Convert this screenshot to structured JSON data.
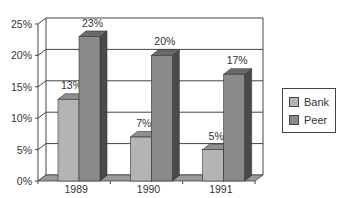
{
  "chart_data": {
    "type": "bar",
    "title": "",
    "xlabel": "",
    "ylabel": "",
    "categories": [
      "1989",
      "1990",
      "1991"
    ],
    "series": [
      {
        "name": "Bank",
        "values": [
          13,
          7,
          5
        ],
        "labels": [
          "13%",
          "7%",
          "5%"
        ],
        "color": "#b4b4b4"
      },
      {
        "name": "Peer",
        "values": [
          23,
          20,
          17
        ],
        "labels": [
          "23%",
          "20%",
          "17%"
        ],
        "color": "#8a8a8a"
      }
    ],
    "ylim": [
      0,
      25
    ],
    "yticks": [
      "0%",
      "5%",
      "10%",
      "15%",
      "20%",
      "25%"
    ],
    "grid": true,
    "legend_position": "right",
    "style": "3d-clustered-column"
  },
  "legend": {
    "items": [
      {
        "label": "Bank",
        "color": "#b4b4b4"
      },
      {
        "label": "Peer",
        "color": "#8a8a8a"
      }
    ]
  }
}
